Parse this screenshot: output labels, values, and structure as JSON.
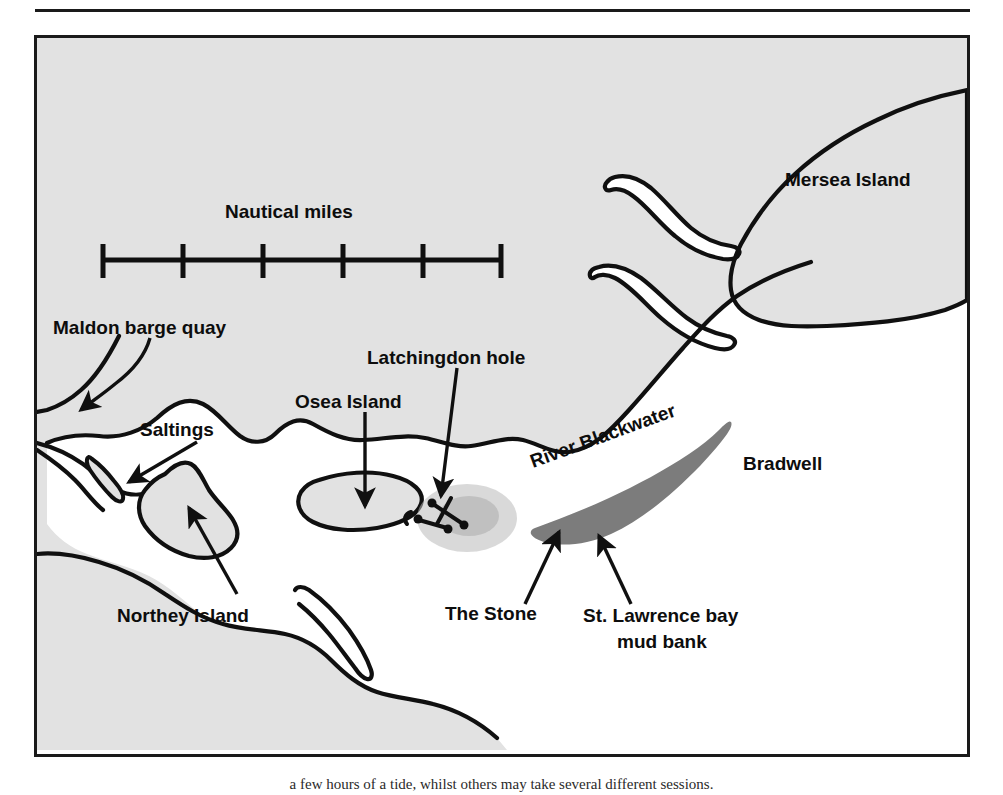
{
  "figure": {
    "caption": "a few hours of a tide, whilst others may take several different sessions."
  },
  "map": {
    "title_scale": "Nautical miles",
    "scale_bar": {
      "label": "Nautical miles",
      "segments": 5,
      "tick_count": 6,
      "ticks": [
        "0",
        "1",
        "2",
        "3",
        "4",
        "5"
      ]
    },
    "colors": {
      "land": "#e2e2e2",
      "water": "#ffffff",
      "mudbank": "#7c7c7c",
      "ink": "#101010",
      "frame": "#1a1a1a"
    },
    "labels": [
      {
        "id": "mersea-island",
        "text": "Mersea Island",
        "x": 782,
        "y": 150,
        "anchor": "start"
      },
      {
        "id": "maldon-barge-quay",
        "text": "Maldon barge quay",
        "x": 47,
        "y": 320,
        "anchor": "start"
      },
      {
        "id": "saltings",
        "text": "Saltings",
        "x": 131,
        "y": 395,
        "anchor": "start"
      },
      {
        "id": "osea-island",
        "text": "Osea Island",
        "x": 289,
        "y": 364,
        "anchor": "start"
      },
      {
        "id": "latchingdon-hole",
        "text": "Latchingdon hole",
        "x": 362,
        "y": 320,
        "anchor": "start"
      },
      {
        "id": "river-blackwater",
        "text": "River Blackwater",
        "x": 527,
        "y": 435,
        "anchor": "start",
        "rotate": -20
      },
      {
        "id": "bradwell",
        "text": "Bradwell",
        "x": 737,
        "y": 437,
        "anchor": "start"
      },
      {
        "id": "northey-island",
        "text": "Northey Island",
        "x": 113,
        "y": 587,
        "anchor": "start"
      },
      {
        "id": "the-stone",
        "text": "The Stone",
        "x": 441,
        "y": 584,
        "anchor": "start"
      },
      {
        "id": "st-lawrence-line1",
        "text": "St. Lawrence bay",
        "x": 578,
        "y": 584,
        "anchor": "start"
      },
      {
        "id": "st-lawrence-line2",
        "text": "mud bank",
        "x": 612,
        "y": 609,
        "anchor": "start"
      }
    ],
    "features": [
      {
        "id": "mersea-island",
        "name": "Mersea Island",
        "type": "island"
      },
      {
        "id": "osea-island",
        "name": "Osea Island",
        "type": "island"
      },
      {
        "id": "northey-island",
        "name": "Northey Island",
        "type": "island"
      },
      {
        "id": "saltings",
        "name": "Saltings",
        "type": "saltmarsh"
      },
      {
        "id": "maldon-barge-quay",
        "name": "Maldon barge quay",
        "type": "quay"
      },
      {
        "id": "latchingdon-hole",
        "name": "Latchingdon hole",
        "type": "anchorage"
      },
      {
        "id": "the-stone",
        "name": "The Stone",
        "type": "point"
      },
      {
        "id": "river-blackwater",
        "name": "River Blackwater",
        "type": "river"
      },
      {
        "id": "bradwell",
        "name": "Bradwell",
        "type": "settlement"
      },
      {
        "id": "st-lawrence-bay",
        "name": "St. Lawrence bay mud bank",
        "type": "mudbank"
      }
    ]
  }
}
